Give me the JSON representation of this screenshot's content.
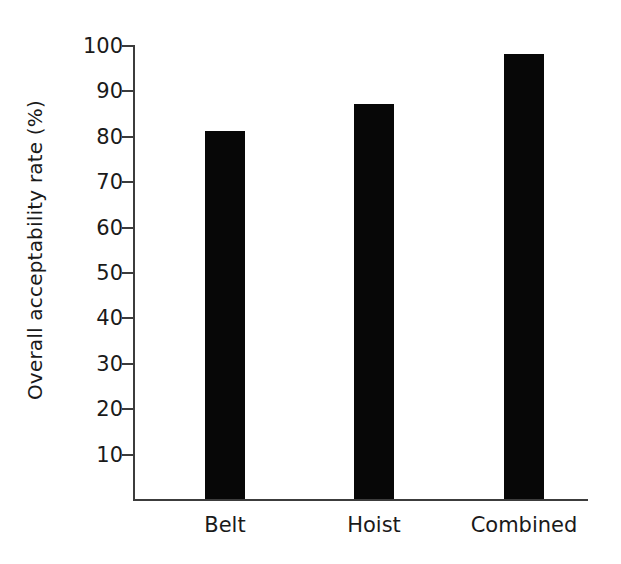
{
  "chart_data": {
    "type": "bar",
    "title": "",
    "xlabel": "",
    "ylabel": "Overall acceptability rate (%)",
    "categories": [
      "Belt",
      "Hoist",
      "Combined"
    ],
    "values": [
      81,
      87,
      98
    ],
    "ylim": [
      0,
      100
    ],
    "yticks": [
      10,
      20,
      30,
      40,
      50,
      60,
      70,
      80,
      90,
      100
    ],
    "ytick_labels": [
      "10",
      "20",
      "30",
      "40",
      "50",
      "60",
      "70",
      "80",
      "90",
      "100"
    ],
    "grid": false,
    "legend": null,
    "bar_color": "#070707",
    "axis_color": "#3c3c3c",
    "background": "#ffffff",
    "series": [
      {
        "name": "Overall acceptability rate",
        "values": [
          81,
          87,
          98
        ]
      }
    ],
    "annotations": []
  },
  "axis": {
    "y_title": "Overall acceptability rate (%)"
  }
}
